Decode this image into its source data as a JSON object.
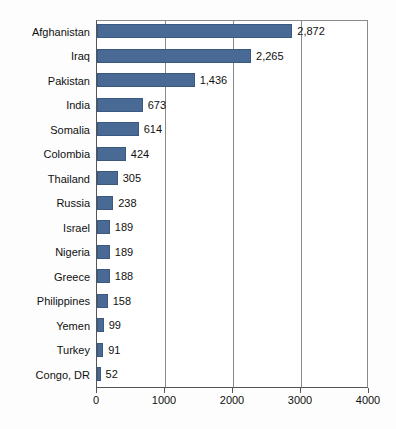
{
  "chart_data": {
    "type": "bar",
    "orientation": "horizontal",
    "title": "",
    "subtitle": "",
    "xlabel": "",
    "ylabel": "",
    "xlim": [
      0,
      4000
    ],
    "xticks": [
      0,
      1000,
      2000,
      3000,
      4000
    ],
    "xtick_labels": [
      "0",
      "1000",
      "2000",
      "3000",
      "4000"
    ],
    "grid": true,
    "grid_axis": "x",
    "legend": false,
    "legend_position": "none",
    "bar_color": "#4a6a96",
    "categories": [
      "Afghanistan",
      "Iraq",
      "Pakistan",
      "India",
      "Somalia",
      "Colombia",
      "Thailand",
      "Russia",
      "Israel",
      "Nigeria",
      "Greece",
      "Philippines",
      "Yemen",
      "Turkey",
      "Congo, DR"
    ],
    "values": [
      2872,
      2265,
      1436,
      673,
      614,
      424,
      305,
      238,
      189,
      189,
      188,
      158,
      99,
      91,
      52
    ],
    "value_labels": [
      "2,872",
      "2,265",
      "1,436",
      "673",
      "614",
      "424",
      "305",
      "238",
      "189",
      "189",
      "188",
      "158",
      "99",
      "91",
      "52"
    ]
  }
}
